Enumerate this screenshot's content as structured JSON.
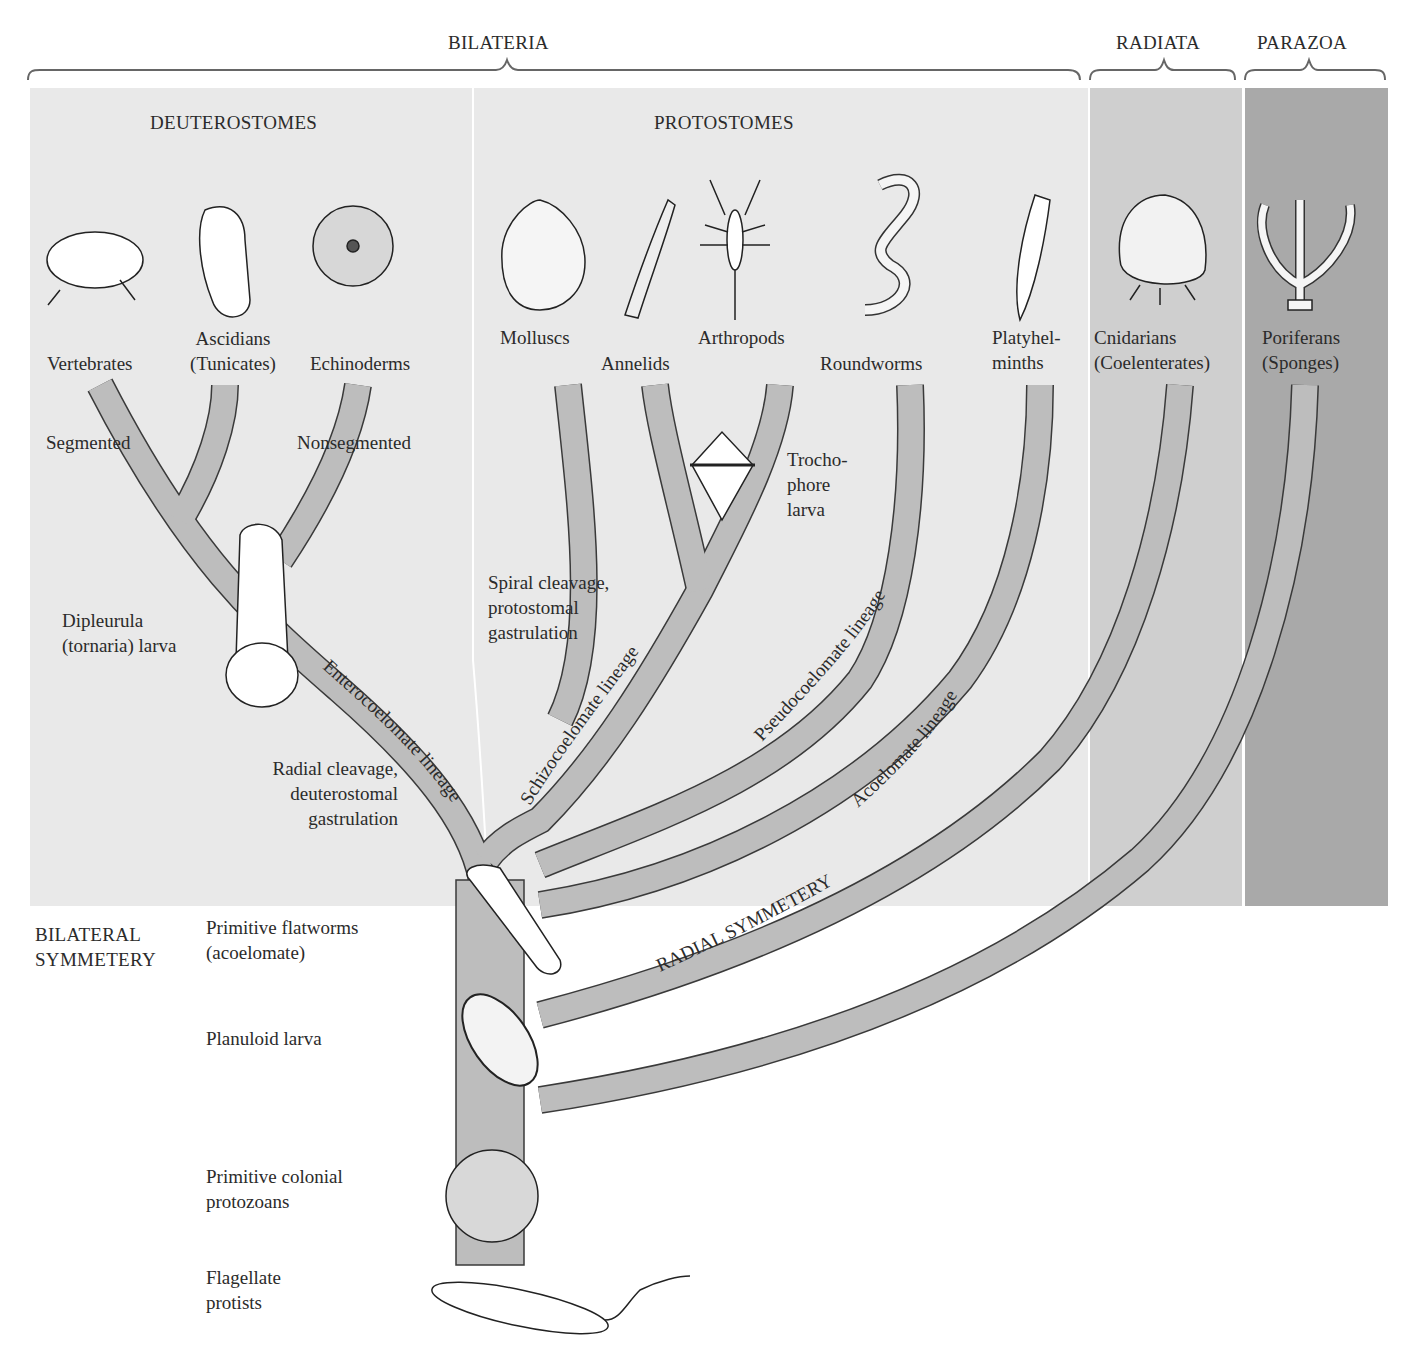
{
  "colors": {
    "bilateria_bg": "#e9e9e9",
    "radiata_bg": "#cfcfcf",
    "parazoa_bg": "#a9a9a9",
    "branch_fill": "#bdbdbd",
    "branch_stroke": "#3a3a3a",
    "text": "#2b2b2b"
  },
  "groups": {
    "bilateria": "BILATERIA",
    "radiata": "RADIATA",
    "parazoa": "PARAZOA",
    "deuterostomes": "DEUTEROSTOMES",
    "protostomes": "PROTOSTOMES"
  },
  "taxa": {
    "vertebrates": "Vertebrates",
    "ascidians_1": "Ascidians",
    "ascidians_2": "(Tunicates)",
    "echinoderms": "Echinoderms",
    "molluscs": "Molluscs",
    "annelids": "Annelids",
    "arthropods": "Arthropods",
    "roundworms": "Roundworms",
    "platyhelminths_1": "Platyhel-",
    "platyhelminths_2": "minths",
    "cnidarians_1": "Cnidarians",
    "cnidarians_2": "(Coelenterates)",
    "poriferans_1": "Poriferans",
    "poriferans_2": "(Sponges)"
  },
  "annotations": {
    "segmented": "Segmented",
    "nonsegmented": "Nonsegmented",
    "trochophore_1": "Trocho-",
    "trochophore_2": "phore",
    "trochophore_3": "larva",
    "dipleurula_1": "Dipleurula",
    "dipleurula_2": "(tornaria) larva",
    "spiral_1": "Spiral cleavage,",
    "spiral_2": "protostomal",
    "spiral_3": "gastrulation",
    "radial_1": "Radial cleavage,",
    "radial_2": "deuterostomal",
    "radial_3": "gastrulation"
  },
  "lineages": {
    "enterocoelomate": "Enterocoelomate lineage",
    "schizocoelomate": "Schizocoelomate lineage",
    "pseudocoelomate": "Pseudocoelomate lineage",
    "acoelomate": "Acoelomate lineage",
    "radial_symmetry": "RADIAL SYMMETERY"
  },
  "base": {
    "bilateral_1": "BILATERAL",
    "bilateral_2": "SYMMETERY",
    "flatworms_1": "Primitive flatworms",
    "flatworms_2": "(acoelomate)",
    "planuloid": "Planuloid larva",
    "colonial_1": "Primitive colonial",
    "colonial_2": "protozoans",
    "flagellate_1": "Flagellate",
    "flagellate_2": "protists"
  }
}
